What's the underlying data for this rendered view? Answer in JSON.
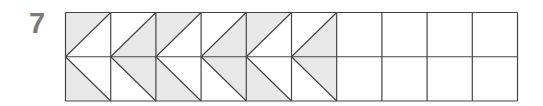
{
  "problem": {
    "number": "7"
  },
  "grid": {
    "columns": 10,
    "rows": 2,
    "x": 65.5,
    "y": 12.5,
    "cell_width": 45.2,
    "cell_height": 44.25,
    "shade_color": "#e8e8e8",
    "line_color": "#444444",
    "shaded_columns": [
      {
        "col": 1,
        "top": "upper-left",
        "bottom": "lower-left"
      },
      {
        "col": 2,
        "top": "lower-right",
        "bottom": "upper-right"
      },
      {
        "col": 3,
        "top": "upper-left",
        "bottom": "lower-left"
      },
      {
        "col": 4,
        "top": "lower-right",
        "bottom": "upper-right"
      },
      {
        "col": 5,
        "top": "upper-left",
        "bottom": "lower-left"
      },
      {
        "col": 6,
        "top": "lower-right",
        "bottom": "upper-right"
      }
    ],
    "empty_columns": [
      7,
      8,
      9,
      10
    ]
  }
}
